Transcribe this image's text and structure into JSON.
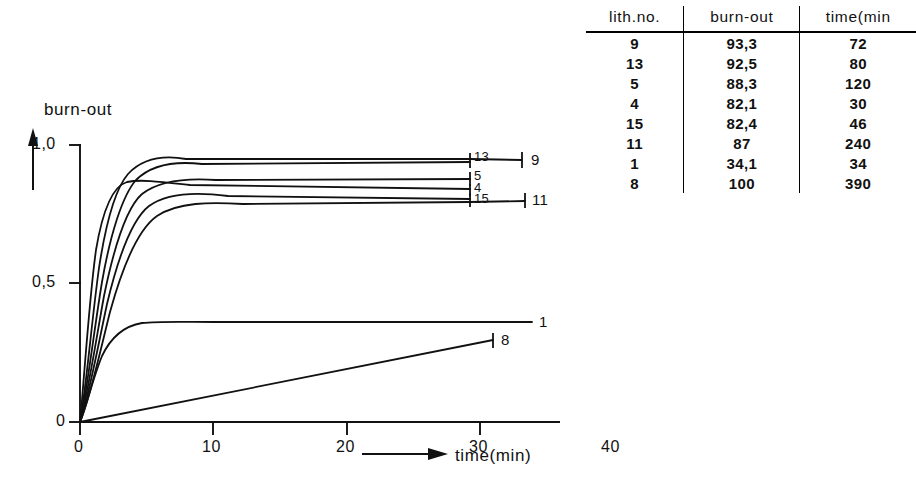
{
  "chart_data": {
    "type": "line",
    "title": "",
    "ylabel": "burn-out",
    "xlabel": "time(min)",
    "xlim": [
      0,
      40
    ],
    "ylim": [
      0,
      1.0
    ],
    "xticks": [
      0,
      10,
      20,
      30,
      40
    ],
    "xtick_labels": [
      "0",
      "10",
      "20",
      "30",
      "40"
    ],
    "yticks": [
      0,
      0.5,
      1.0
    ],
    "ytick_labels": [
      "0",
      "0,5",
      "1,0"
    ],
    "grid": false,
    "legend": "curve end labels",
    "series": [
      {
        "name": "9",
        "label": "9",
        "plateau": 0.955,
        "rise_time": 3.3,
        "end_x": 33.1,
        "shape": "saturating"
      },
      {
        "name": "13",
        "label": "13",
        "plateau": 0.953,
        "rise_time": 3.8,
        "end_x": 28.5,
        "shape": "saturating"
      },
      {
        "name": "5",
        "label": "5",
        "plateau": 0.882,
        "rise_time": 3.2,
        "end_x": 28.5,
        "shape": "saturating"
      },
      {
        "name": "4",
        "label": "4",
        "plateau": 0.845,
        "rise_time": 1.9,
        "end_x": 28.5,
        "shape": "saturating-early"
      },
      {
        "name": "15",
        "label": "15",
        "plateau": 0.812,
        "rise_time": 3.6,
        "end_x": 28.5,
        "shape": "saturating"
      },
      {
        "name": "11",
        "label": "11",
        "plateau": 0.81,
        "rise_time": 4.2,
        "end_x": 33.3,
        "shape": "saturating"
      },
      {
        "name": "1",
        "label": "1",
        "plateau": 0.36,
        "rise_time": 1.6,
        "end_x": 33.9,
        "shape": "saturating"
      },
      {
        "name": "8",
        "label": "8",
        "plateau": 0.3,
        "rise_time": 0,
        "end_x": 31.0,
        "shape": "linear"
      }
    ]
  },
  "chart": {
    "y_axis_title": "burn-out",
    "x_axis_title": "time(min)",
    "y_tick_top": "1,0",
    "y_tick_mid": "0,5",
    "y_tick_zero": "0",
    "x_tick_0": "0",
    "x_tick_10": "10",
    "x_tick_20": "20",
    "x_tick_30": "30",
    "x_tick_40": "40",
    "curve_labels": {
      "l13": "13",
      "l9": "9",
      "l5": "5",
      "l4": "4",
      "l15": "15",
      "l11": "11",
      "l1": "1",
      "l8": "8"
    }
  },
  "table": {
    "headers": [
      "lith.no.",
      "burn-out",
      "time(min"
    ],
    "rows": [
      {
        "lith_no": "9",
        "burn_out": "93,3",
        "time": "72"
      },
      {
        "lith_no": "13",
        "burn_out": "92,5",
        "time": "80"
      },
      {
        "lith_no": "5",
        "burn_out": "88,3",
        "time": "120"
      },
      {
        "lith_no": "4",
        "burn_out": "82,1",
        "time": "30"
      },
      {
        "lith_no": "15",
        "burn_out": "82,4",
        "time": "46"
      },
      {
        "lith_no": "11",
        "burn_out": "87",
        "time": "240"
      },
      {
        "lith_no": "1",
        "burn_out": "34,1",
        "time": "34"
      },
      {
        "lith_no": "8",
        "burn_out": "100",
        "time": "390"
      }
    ]
  },
  "colors": {
    "ink": "#111111",
    "background": "#ffffff"
  }
}
